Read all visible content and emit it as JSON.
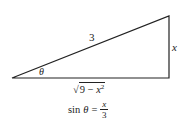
{
  "diagram": {
    "type": "right-triangle",
    "stroke_color": "#222222",
    "vertices": {
      "angle_vertex": [
        12,
        78
      ],
      "right_angle_vertex": [
        169,
        78
      ],
      "top_vertex": [
        169,
        16
      ]
    },
    "labels": {
      "hypotenuse": "3",
      "opposite": "x",
      "angle": "θ",
      "adjacent_radical_sign": "√",
      "adjacent_radicand_prefix": "9 − ",
      "adjacent_var": "x",
      "adjacent_exp": "2"
    },
    "equation": {
      "lhs": "sin",
      "angle": "θ",
      "equals": "=",
      "numerator": "x",
      "denominator": "3"
    }
  }
}
